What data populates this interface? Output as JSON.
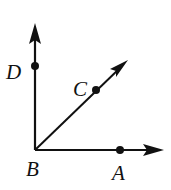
{
  "diagram": {
    "type": "geometry-rays",
    "vertex": {
      "label": "B",
      "x": 35,
      "y": 150
    },
    "rays": [
      {
        "name": "ray-BD",
        "through": "D",
        "tip": {
          "x": 35,
          "y": 24
        }
      },
      {
        "name": "ray-BC",
        "through": "C",
        "tip": {
          "x": 127,
          "y": 61
        }
      },
      {
        "name": "ray-BA",
        "through": "A",
        "tip": {
          "x": 163,
          "y": 150
        }
      }
    ],
    "points": [
      {
        "label": "D",
        "x": 35,
        "y": 66,
        "label_x": 6,
        "label_y": 79
      },
      {
        "label": "C",
        "x": 96,
        "y": 90,
        "label_x": 73,
        "label_y": 96
      },
      {
        "label": "B",
        "x": 35,
        "y": 150,
        "label_x": 26,
        "label_y": 176
      },
      {
        "label": "A",
        "x": 120,
        "y": 150,
        "label_x": 112,
        "label_y": 180
      }
    ],
    "colors": {
      "stroke": "#111111",
      "background": "#ffffff"
    }
  }
}
